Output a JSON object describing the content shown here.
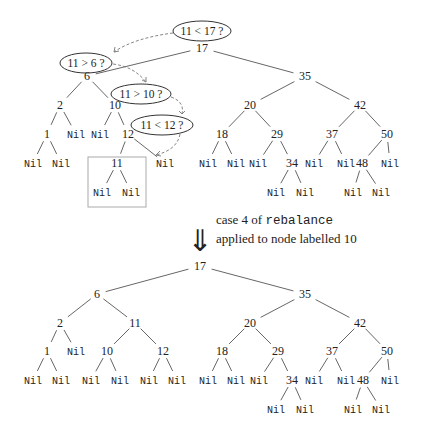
{
  "figure": {
    "before_tree": {
      "root": "17",
      "nodes": [
        {
          "id": "t17",
          "label": "17",
          "x": 202,
          "y": 52
        },
        {
          "id": "t6",
          "label": "6",
          "x": 87,
          "y": 80
        },
        {
          "id": "t35",
          "label": "35",
          "x": 305,
          "y": 80
        },
        {
          "id": "t2",
          "label": "2",
          "x": 60,
          "y": 109
        },
        {
          "id": "t10",
          "label": "10",
          "x": 115,
          "y": 109
        },
        {
          "id": "t20",
          "label": "20",
          "x": 250,
          "y": 109
        },
        {
          "id": "t42",
          "label": "42",
          "x": 360,
          "y": 109
        },
        {
          "id": "t1",
          "label": "1",
          "x": 47,
          "y": 138
        },
        {
          "id": "tn2r",
          "label": "Nil",
          "x": 76,
          "y": 138
        },
        {
          "id": "tn10l",
          "label": "Nil",
          "x": 100,
          "y": 138
        },
        {
          "id": "t12",
          "label": "12",
          "x": 128,
          "y": 138
        },
        {
          "id": "t18",
          "label": "18",
          "x": 222,
          "y": 138
        },
        {
          "id": "t29",
          "label": "29",
          "x": 277,
          "y": 138
        },
        {
          "id": "t37",
          "label": "37",
          "x": 332,
          "y": 138
        },
        {
          "id": "t50",
          "label": "50",
          "x": 387,
          "y": 138
        },
        {
          "id": "tn1l",
          "label": "Nil",
          "x": 33,
          "y": 167
        },
        {
          "id": "tn1r",
          "label": "Nil",
          "x": 61,
          "y": 167
        },
        {
          "id": "t11",
          "label": "11",
          "x": 117,
          "y": 167
        },
        {
          "id": "tn12r",
          "label": "Nil",
          "x": 165,
          "y": 167
        },
        {
          "id": "tn18l",
          "label": "Nil",
          "x": 208,
          "y": 167
        },
        {
          "id": "tn18r",
          "label": "Nil",
          "x": 236,
          "y": 167
        },
        {
          "id": "tn29l",
          "label": "Nil",
          "x": 258,
          "y": 167
        },
        {
          "id": "t34",
          "label": "34",
          "x": 292,
          "y": 167
        },
        {
          "id": "tn37l",
          "label": "Nil",
          "x": 314,
          "y": 167
        },
        {
          "id": "tn37r",
          "label": "Nil",
          "x": 346,
          "y": 167
        },
        {
          "id": "t48",
          "label": "48",
          "x": 362,
          "y": 167
        },
        {
          "id": "tn50r",
          "label": "Nil",
          "x": 390,
          "y": 167
        },
        {
          "id": "tn11l",
          "label": "Nil",
          "x": 102,
          "y": 196
        },
        {
          "id": "tn11r",
          "label": "Nil",
          "x": 131,
          "y": 196
        },
        {
          "id": "tn34l",
          "label": "Nil",
          "x": 276,
          "y": 196
        },
        {
          "id": "tn34r",
          "label": "Nil",
          "x": 305,
          "y": 196
        },
        {
          "id": "tn48l",
          "label": "Nil",
          "x": 353,
          "y": 196
        },
        {
          "id": "tn48r",
          "label": "Nil",
          "x": 381,
          "y": 196
        }
      ],
      "edges": [
        [
          "t17",
          "t6"
        ],
        [
          "t17",
          "t35"
        ],
        [
          "t6",
          "t2"
        ],
        [
          "t6",
          "t10"
        ],
        [
          "t35",
          "t20"
        ],
        [
          "t35",
          "t42"
        ],
        [
          "t2",
          "t1"
        ],
        [
          "t2",
          "tn2r"
        ],
        [
          "t10",
          "tn10l"
        ],
        [
          "t10",
          "t12"
        ],
        [
          "t20",
          "t18"
        ],
        [
          "t20",
          "t29"
        ],
        [
          "t42",
          "t37"
        ],
        [
          "t42",
          "t50"
        ],
        [
          "t1",
          "tn1l"
        ],
        [
          "t1",
          "tn1r"
        ],
        [
          "t12",
          "t11"
        ],
        [
          "t12",
          "tn12r"
        ],
        [
          "t18",
          "tn18l"
        ],
        [
          "t18",
          "tn18r"
        ],
        [
          "t29",
          "tn29l"
        ],
        [
          "t29",
          "t34"
        ],
        [
          "t37",
          "tn37l"
        ],
        [
          "t37",
          "tn37r"
        ],
        [
          "t50",
          "t48"
        ],
        [
          "t50",
          "tn50r"
        ],
        [
          "t11",
          "tn11l"
        ],
        [
          "t11",
          "tn11r"
        ],
        [
          "t34",
          "tn34l"
        ],
        [
          "t34",
          "tn34r"
        ],
        [
          "t48",
          "tn48l"
        ],
        [
          "t48",
          "tn48r"
        ]
      ],
      "highlight_box": {
        "x": 88,
        "y": 157,
        "w": 58,
        "h": 50,
        "color": "#aaaaaa"
      },
      "comparisons": [
        {
          "label": "11 < 17 ?",
          "cx": 202,
          "cy": 31,
          "rx": 29,
          "ry": 10
        },
        {
          "label": "11 > 6 ?",
          "cx": 86,
          "cy": 63,
          "rx": 26,
          "ry": 10
        },
        {
          "label": "11 > 10 ?",
          "cx": 141,
          "cy": 94,
          "rx": 30,
          "ry": 10
        },
        {
          "label": "11 < 12 ?",
          "cx": 162,
          "cy": 125,
          "rx": 31,
          "ry": 10
        }
      ]
    },
    "transition": {
      "arrow_glyph": "⇓",
      "caption_line1_prefix": "case 4 of ",
      "caption_line1_code": "rebalance",
      "caption_line2": "applied to node labelled 10"
    },
    "after_tree": {
      "root": "17",
      "nodes": [
        {
          "id": "b17",
          "label": "17",
          "x": 200,
          "y": 270
        },
        {
          "id": "b6",
          "label": "6",
          "x": 97,
          "y": 298
        },
        {
          "id": "b35",
          "label": "35",
          "x": 305,
          "y": 298
        },
        {
          "id": "b2",
          "label": "2",
          "x": 60,
          "y": 327
        },
        {
          "id": "b11",
          "label": "11",
          "x": 135,
          "y": 327
        },
        {
          "id": "b20",
          "label": "20",
          "x": 250,
          "y": 327
        },
        {
          "id": "b42",
          "label": "42",
          "x": 360,
          "y": 327
        },
        {
          "id": "b1",
          "label": "1",
          "x": 47,
          "y": 355
        },
        {
          "id": "bn2r",
          "label": "Nil",
          "x": 76,
          "y": 355
        },
        {
          "id": "b10",
          "label": "10",
          "x": 107,
          "y": 355
        },
        {
          "id": "b12",
          "label": "12",
          "x": 163,
          "y": 355
        },
        {
          "id": "b18",
          "label": "18",
          "x": 222,
          "y": 355
        },
        {
          "id": "b29",
          "label": "29",
          "x": 278,
          "y": 355
        },
        {
          "id": "b37",
          "label": "37",
          "x": 332,
          "y": 355
        },
        {
          "id": "b50",
          "label": "50",
          "x": 387,
          "y": 355
        },
        {
          "id": "bn1l",
          "label": "Nil",
          "x": 33,
          "y": 384
        },
        {
          "id": "bn1r",
          "label": "Nil",
          "x": 61,
          "y": 384
        },
        {
          "id": "bn10l",
          "label": "Nil",
          "x": 91,
          "y": 384
        },
        {
          "id": "bn10r",
          "label": "Nil",
          "x": 120,
          "y": 384
        },
        {
          "id": "bn12l",
          "label": "Nil",
          "x": 149,
          "y": 384
        },
        {
          "id": "bn12r",
          "label": "Nil",
          "x": 177,
          "y": 384
        },
        {
          "id": "bn18l",
          "label": "Nil",
          "x": 208,
          "y": 384
        },
        {
          "id": "bn18r",
          "label": "Nil",
          "x": 236,
          "y": 384
        },
        {
          "id": "bn29l",
          "label": "Nil",
          "x": 259,
          "y": 384
        },
        {
          "id": "b34",
          "label": "34",
          "x": 292,
          "y": 384
        },
        {
          "id": "bn37l",
          "label": "Nil",
          "x": 314,
          "y": 384
        },
        {
          "id": "bn37r",
          "label": "Nil",
          "x": 346,
          "y": 384
        },
        {
          "id": "b48",
          "label": "48",
          "x": 363,
          "y": 384
        },
        {
          "id": "bn50r",
          "label": "Nil",
          "x": 390,
          "y": 384
        },
        {
          "id": "bn34l",
          "label": "Nil",
          "x": 276,
          "y": 413
        },
        {
          "id": "bn34r",
          "label": "Nil",
          "x": 305,
          "y": 413
        },
        {
          "id": "bn48l",
          "label": "Nil",
          "x": 353,
          "y": 413
        },
        {
          "id": "bn48r",
          "label": "Nil",
          "x": 381,
          "y": 413
        }
      ],
      "edges": [
        [
          "b17",
          "b6"
        ],
        [
          "b17",
          "b35"
        ],
        [
          "b6",
          "b2"
        ],
        [
          "b6",
          "b11"
        ],
        [
          "b35",
          "b20"
        ],
        [
          "b35",
          "b42"
        ],
        [
          "b2",
          "b1"
        ],
        [
          "b2",
          "bn2r"
        ],
        [
          "b11",
          "b10"
        ],
        [
          "b11",
          "b12"
        ],
        [
          "b20",
          "b18"
        ],
        [
          "b20",
          "b29"
        ],
        [
          "b42",
          "b37"
        ],
        [
          "b42",
          "b50"
        ],
        [
          "b1",
          "bn1l"
        ],
        [
          "b1",
          "bn1r"
        ],
        [
          "b10",
          "bn10l"
        ],
        [
          "b10",
          "bn10r"
        ],
        [
          "b12",
          "bn12l"
        ],
        [
          "b12",
          "bn12r"
        ],
        [
          "b18",
          "bn18l"
        ],
        [
          "b18",
          "bn18r"
        ],
        [
          "b29",
          "bn29l"
        ],
        [
          "b29",
          "b34"
        ],
        [
          "b37",
          "bn37l"
        ],
        [
          "b37",
          "bn37r"
        ],
        [
          "b50",
          "b48"
        ],
        [
          "b50",
          "bn50r"
        ],
        [
          "b34",
          "bn34l"
        ],
        [
          "b34",
          "bn34r"
        ],
        [
          "b48",
          "bn48l"
        ],
        [
          "b48",
          "bn48r"
        ]
      ]
    }
  }
}
